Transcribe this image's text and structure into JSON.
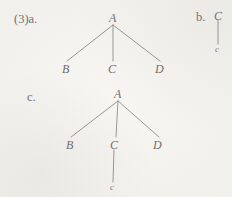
{
  "figure": {
    "number": "(3)",
    "background_color": "#f7f6f2",
    "ink_color": "#6e6e6e",
    "line_color": "#8d8d8d"
  },
  "items": {
    "a": {
      "enumerator": "(3)a.",
      "root": "A",
      "leaves": [
        "B",
        "C",
        "D"
      ]
    },
    "b": {
      "enumerator": "b.",
      "root": "C",
      "child": "c"
    },
    "c": {
      "enumerator": "c.",
      "root": "A",
      "leaves": [
        "B",
        "C",
        "D"
      ],
      "sub_child": "c"
    }
  },
  "nodes": {
    "tree_a": {
      "root_label": "A",
      "leaf_left_label": "B",
      "leaf_mid_label": "C",
      "leaf_right_label": "D"
    },
    "tree_b": {
      "top_label": "C",
      "bottom_label": "c"
    },
    "tree_c": {
      "root_label": "A",
      "leaf_left_label": "B",
      "leaf_mid_label": "C",
      "leaf_right_label": "D",
      "terminal_label": "c"
    }
  }
}
